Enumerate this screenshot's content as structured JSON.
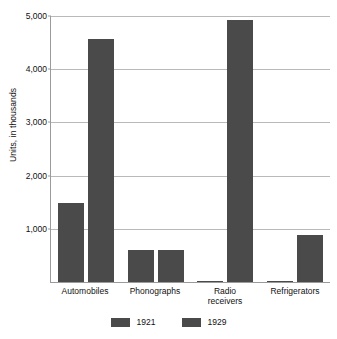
{
  "chart_data": {
    "type": "bar",
    "title": "",
    "xlabel": "",
    "ylabel": "Units, in thousands",
    "ylim": [
      0,
      5000
    ],
    "yticks": [
      1000,
      2000,
      3000,
      4000,
      5000
    ],
    "ytick_labels": [
      "1,000",
      "2,000",
      "3,000",
      "4,000",
      "5,000"
    ],
    "grid": true,
    "legend_position": "bottom",
    "categories": [
      "Automobiles",
      "Phonographs",
      "Radio receivers",
      "Refrigerators"
    ],
    "category_lines": [
      [
        "Automobiles"
      ],
      [
        "Phonographs"
      ],
      [
        "Radio",
        "receivers"
      ],
      [
        "Refrigerators"
      ]
    ],
    "series": [
      {
        "name": "1921",
        "color": "#4a4a4a",
        "values": [
          1480,
          600,
          5,
          5
        ]
      },
      {
        "name": "1929",
        "color": "#4a4a4a",
        "values": [
          4560,
          610,
          4930,
          880
        ]
      }
    ]
  },
  "colors": {
    "bar": "#4a4a4a",
    "gridline": "#b9b9b9",
    "axis": "#9b9b9b",
    "text": "#111111",
    "background": "#ffffff"
  }
}
